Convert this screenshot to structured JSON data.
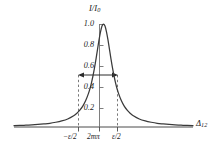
{
  "figure": {
    "kind": "lorentzian-transmission-plot",
    "background_color": "#ffffff",
    "curve_color": "#3a3a3a",
    "axis_color": "#4a4a4a",
    "dash_color": "#6b6b6b"
  },
  "chart_data": {
    "type": "line",
    "title": "I/I",
    "title_sub": "0",
    "xlabel": "Δ",
    "xlabel_sub": "12",
    "ylabel": "",
    "ylim": [
      0,
      1.08
    ],
    "xlim": [
      -6.0,
      6.0
    ],
    "grid": false,
    "legend": null,
    "y_ticks": [
      "1.0",
      "0.8",
      "0.6",
      "0.4",
      "0.2"
    ],
    "y_tick_values": [
      1.0,
      0.8,
      0.6,
      0.4,
      0.2
    ],
    "x_ticks": [
      "−ε/2",
      "2mπ",
      "ε/2"
    ],
    "x_tick_values": [
      -0.7,
      0.0,
      0.7
    ],
    "annotations": [
      {
        "name": "fwhm-arrow",
        "type": "double-headed-arrow",
        "y_value": 0.5,
        "x_from": -0.7,
        "x_to": 0.7,
        "label": ""
      },
      {
        "name": "left-halfwidth-dashed-line",
        "type": "vertical-dashed",
        "x_value": -0.7,
        "y_from": 0.0,
        "y_to": 0.5
      },
      {
        "name": "right-halfwidth-dashed-line",
        "type": "vertical-dashed",
        "x_value": 0.7,
        "y_from": 0.0,
        "y_to": 0.5
      },
      {
        "name": "center-vertical-axis",
        "type": "vertical-solid",
        "x_value": 0.0,
        "y_from": 0.0,
        "y_to": 1.0
      }
    ],
    "x": [
      -6.0,
      -5.6,
      -5.2,
      -4.8,
      -4.4,
      -4.0,
      -3.6,
      -3.2,
      -2.8,
      -2.4,
      -2.0,
      -1.8,
      -1.6,
      -1.4,
      -1.2,
      -1.0,
      -0.9,
      -0.8,
      -0.7,
      -0.6,
      -0.5,
      -0.4,
      -0.3,
      -0.2,
      -0.1,
      0.0,
      0.1,
      0.2,
      0.3,
      0.4,
      0.5,
      0.6,
      0.7,
      0.8,
      0.9,
      1.0,
      1.2,
      1.4,
      1.6,
      1.8,
      2.0,
      2.4,
      2.8,
      3.2,
      3.6,
      4.0,
      4.4,
      4.8,
      5.2,
      5.6,
      6.0
    ],
    "y": [
      0.013,
      0.015,
      0.018,
      0.021,
      0.025,
      0.03,
      0.036,
      0.046,
      0.059,
      0.078,
      0.109,
      0.131,
      0.161,
      0.2,
      0.254,
      0.329,
      0.376,
      0.434,
      0.5,
      0.576,
      0.662,
      0.754,
      0.845,
      0.924,
      0.98,
      1.0,
      0.98,
      0.924,
      0.845,
      0.754,
      0.662,
      0.576,
      0.5,
      0.434,
      0.376,
      0.329,
      0.254,
      0.2,
      0.161,
      0.131,
      0.109,
      0.078,
      0.059,
      0.046,
      0.036,
      0.03,
      0.025,
      0.021,
      0.018,
      0.015,
      0.013
    ]
  }
}
